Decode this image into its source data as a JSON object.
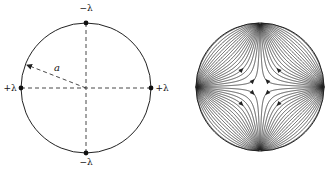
{
  "left_figure": {
    "center": [
      86,
      88
    ],
    "radius": 65,
    "radius_label": "a",
    "charges": [
      {
        "id": "top",
        "label": "−λ",
        "pos": [
          86,
          23
        ],
        "label_pos": [
          86,
          11
        ]
      },
      {
        "id": "bottom",
        "label": "−λ",
        "pos": [
          86,
          153
        ],
        "label_pos": [
          86,
          165
        ]
      },
      {
        "id": "left",
        "label": "+λ",
        "pos": [
          21,
          88
        ],
        "label_pos": [
          10,
          91
        ]
      },
      {
        "id": "right",
        "label": "+λ",
        "pos": [
          151,
          88
        ],
        "label_pos": [
          162,
          91
        ]
      }
    ],
    "radius_arrow_end": [
      27,
      65
    ],
    "radius_label_pos": [
      57,
      71
    ]
  },
  "right_figure": {
    "center": [
      260,
      87
    ],
    "radius": 64,
    "description": "field lines flowing from +λ (left, right) to −λ (top, bottom)",
    "lines_per_charge": 36
  },
  "colors": {
    "stroke": "#222222",
    "background": "#ffffff"
  }
}
